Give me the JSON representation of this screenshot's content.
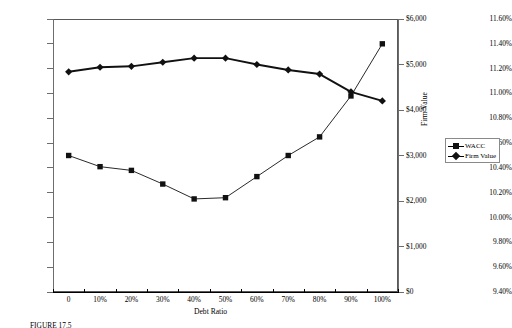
{
  "figure": {
    "caption": "FIGURE 17.5"
  },
  "chart_data": {
    "type": "line",
    "title": "",
    "xlabel": "Debt Ratio",
    "ylabel_left": "",
    "ylabel_right": "Firm Value",
    "categories": [
      "0",
      "10%",
      "20%",
      "30%",
      "40%",
      "50%",
      "60%",
      "70%",
      "80%",
      "90%",
      "100%"
    ],
    "x_values": [
      0,
      10,
      20,
      30,
      40,
      50,
      60,
      70,
      80,
      90,
      100
    ],
    "grid": false,
    "legend_position": "right",
    "left_axis": {
      "ylim": [
        9.4,
        11.6
      ],
      "tick_step": 0.2,
      "tick_labels": [
        "9.40%",
        "9.60%",
        "9.80%",
        "10.00%",
        "10.20%",
        "10.40%",
        "10.60%",
        "10.80%",
        "11.00%",
        "11.20%",
        "11.40%",
        "11.60%"
      ],
      "tick_values": [
        9.4,
        9.6,
        9.8,
        10.0,
        10.2,
        10.4,
        10.6,
        10.8,
        11.0,
        11.2,
        11.4,
        11.6
      ]
    },
    "right_axis": {
      "ylim": [
        0,
        6000
      ],
      "tick_step": 1000,
      "tick_labels": [
        "$0",
        "$1,000",
        "$2,000",
        "$3,000",
        "$4,000",
        "$5,000",
        "$6,000"
      ],
      "tick_values": [
        0,
        1000,
        2000,
        3000,
        4000,
        5000,
        6000
      ]
    },
    "series": [
      {
        "name": "WACC",
        "axis": "left",
        "marker": "square",
        "color": "#111111",
        "values": [
          10.5,
          10.41,
          10.38,
          10.27,
          10.15,
          10.16,
          10.33,
          10.5,
          10.65,
          10.98,
          11.4
        ]
      },
      {
        "name": "Firm Value",
        "axis": "right",
        "marker": "diamond",
        "color": "#111111",
        "values": [
          4840,
          4940,
          4960,
          5050,
          5140,
          5140,
          5000,
          4880,
          4790,
          4400,
          4200
        ]
      }
    ]
  },
  "legend": {
    "items": [
      {
        "label": "WACC",
        "marker": "square"
      },
      {
        "label": "Firm Value",
        "marker": "diamond"
      }
    ]
  }
}
